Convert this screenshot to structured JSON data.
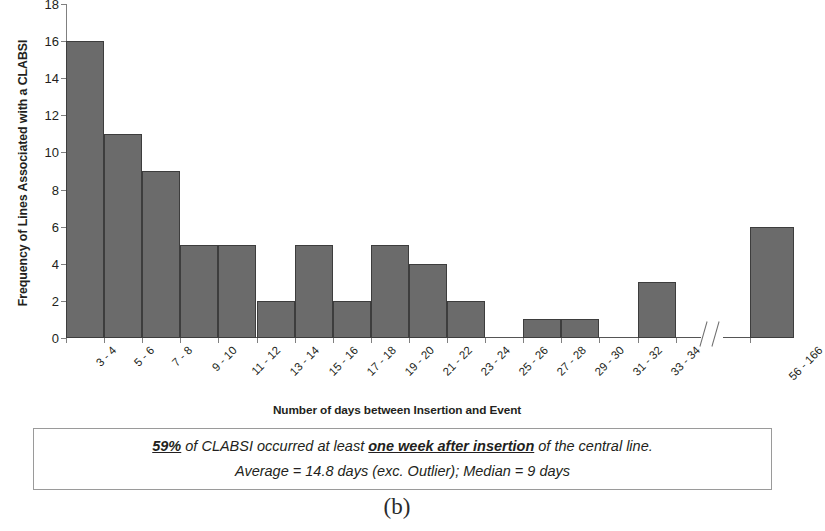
{
  "chart_data": {
    "type": "bar",
    "title": "",
    "subtitle": "",
    "xlabel": "Number of days between Insertion and Event",
    "ylabel": "Frequency of Lines Associated with a CLABSI",
    "categories": [
      "3 - 4",
      "5 - 6",
      "7 - 8",
      "9 - 10",
      "11 - 12",
      "13 - 14",
      "15 - 16",
      "17 - 18",
      "19 - 20",
      "21 - 22",
      "23 - 24",
      "25 - 26",
      "27 - 28",
      "29 - 30",
      "31 - 32",
      "33 - 34",
      "56 - 166"
    ],
    "values": [
      16,
      11,
      9,
      5,
      5,
      2,
      5,
      2,
      5,
      4,
      2,
      0,
      1,
      1,
      0,
      3,
      6
    ],
    "ylim": [
      0,
      18
    ],
    "yticks": [
      0,
      2,
      4,
      6,
      8,
      10,
      12,
      14,
      16,
      18
    ],
    "grid": false,
    "legend": "none",
    "axis_break": {
      "present": true,
      "after_category": "33 - 34",
      "before_category": "56 - 166",
      "symbol": "double-slash"
    },
    "bar_color": "#6b6b6b",
    "bar_edge_color": "#3d3d3d"
  },
  "axes": {
    "y_title": "Frequency of Lines Associated with a CLABSI",
    "x_title": "Number of days between Insertion and Event"
  },
  "annotation": {
    "line1_part1": "59%",
    "line1_part2": " of CLABSI occurred at least ",
    "line1_part3": "one week after insertion",
    "line1_part4": " of the central line.",
    "line2": "Average = 14.8 days (exc. Outlier); Median = 9 days"
  },
  "caption": {
    "label": "(b)"
  }
}
